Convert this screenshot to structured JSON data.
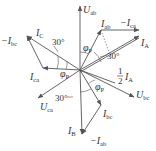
{
  "diagram": {
    "type": "phasor-diagram",
    "colors": {
      "line": "#555555",
      "text": "#333333",
      "background": "#ffffff"
    },
    "origin": [
      80,
      70
    ],
    "vectors": [
      {
        "id": "U_ab",
        "label": "U",
        "sub": "ab",
        "prefix": "",
        "from": [
          80,
          70
        ],
        "to": [
          80,
          6
        ]
      },
      {
        "id": "U_bc",
        "label": "U",
        "sub": "bc",
        "prefix": "",
        "from": [
          80,
          70
        ],
        "to": [
          134,
          97
        ]
      },
      {
        "id": "U_ca",
        "label": "U",
        "sub": "ca",
        "prefix": "",
        "from": [
          80,
          70
        ],
        "to": [
          38,
          98
        ]
      },
      {
        "id": "I_A",
        "label": "I",
        "sub": "A",
        "prefix": "",
        "from": [
          80,
          70
        ],
        "to": [
          139,
          36
        ]
      },
      {
        "id": "I_C",
        "label": "I",
        "sub": "C",
        "prefix": "",
        "from": [
          80,
          70
        ],
        "to": [
          27,
          36
        ]
      },
      {
        "id": "I_B",
        "label": "I",
        "sub": "B",
        "prefix": "",
        "from": [
          80,
          70
        ],
        "to": [
          82,
          134
        ]
      },
      {
        "id": "I_ab",
        "label": "I",
        "sub": "ab",
        "prefix": "",
        "from": [
          80,
          70
        ],
        "to": [
          101,
          30
        ]
      },
      {
        "id": "neg_I_ca",
        "label": "I",
        "sub": "ca",
        "prefix": "−",
        "from": [
          101,
          30
        ],
        "to": [
          139,
          30
        ]
      },
      {
        "id": "I_ca",
        "label": "I",
        "sub": "ca",
        "prefix": "",
        "from": [
          80,
          70
        ],
        "to": [
          43,
          68
        ]
      },
      {
        "id": "neg_I_bc",
        "label": "I",
        "sub": "bc",
        "prefix": "−",
        "from": [
          43,
          68
        ],
        "to": [
          27,
          36
        ]
      },
      {
        "id": "I_bc",
        "label": "I",
        "sub": "bc",
        "prefix": "",
        "from": [
          80,
          70
        ],
        "to": [
          101,
          105
        ]
      },
      {
        "id": "neg_I_ab",
        "label": "I",
        "sub": "ab",
        "prefix": "−",
        "from": [
          101,
          105
        ],
        "to": [
          82,
          134
        ]
      }
    ],
    "labels": {
      "U_ab": {
        "text": "U",
        "sub": "ab"
      },
      "U_bc": {
        "text": "U",
        "sub": "bc"
      },
      "U_ca": {
        "text": "U",
        "sub": "ca"
      },
      "I_A": {
        "text": "I",
        "sub": "A"
      },
      "I_B": {
        "text": "I",
        "sub": "B"
      },
      "I_C": {
        "text": "I",
        "sub": "C"
      },
      "I_ab": {
        "text": "I",
        "sub": "ab"
      },
      "I_bc": {
        "text": "I",
        "sub": "bc"
      },
      "I_ca": {
        "text": "I",
        "sub": "ca"
      },
      "neg_I_ca": {
        "text": "−I",
        "sub": "ca"
      },
      "neg_I_bc": {
        "text": "−I",
        "sub": "bc"
      },
      "neg_I_ab": {
        "text": "−I",
        "sub": "ab"
      },
      "half_I_A": {
        "num": "1",
        "den": "2",
        "text": "I",
        "sub": "A"
      }
    },
    "angles": {
      "thirty_1": "30°",
      "thirty_2": "30°",
      "thirty_3": "30°",
      "phi": "φ",
      "phi_sub": "P"
    }
  }
}
